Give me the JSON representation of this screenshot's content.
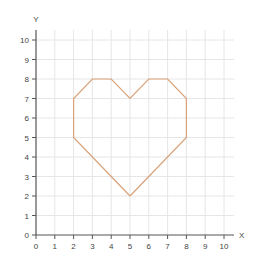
{
  "chart_data": {
    "type": "line",
    "title": "",
    "xlabel": "X",
    "ylabel": "Y",
    "xlim": [
      0,
      10
    ],
    "ylim": [
      0,
      10
    ],
    "grid": true,
    "x_ticks": [
      "0",
      "1",
      "2",
      "3",
      "4",
      "5",
      "6",
      "7",
      "8",
      "9",
      "10"
    ],
    "y_ticks": [
      "0",
      "1",
      "2",
      "3",
      "4",
      "5",
      "6",
      "7",
      "8",
      "9",
      "10"
    ],
    "series": [
      {
        "name": "heart",
        "color": "#d9a27a",
        "closed": true,
        "points": [
          [
            5,
            2
          ],
          [
            8,
            5
          ],
          [
            8,
            7
          ],
          [
            7,
            8
          ],
          [
            6,
            8
          ],
          [
            5,
            7
          ],
          [
            4,
            8
          ],
          [
            3,
            8
          ],
          [
            2,
            7
          ],
          [
            2,
            5
          ],
          [
            5,
            2
          ]
        ]
      }
    ]
  }
}
